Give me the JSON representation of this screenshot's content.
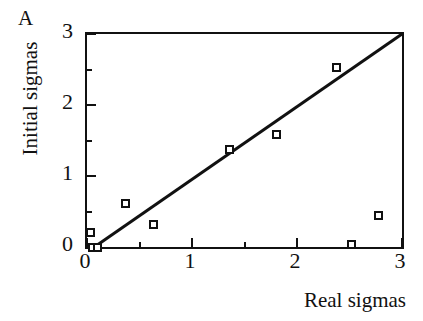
{
  "panel": {
    "label": "A"
  },
  "chart_data": {
    "type": "scatter",
    "title": "",
    "subtitle": "",
    "xlabel": "Real sigmas",
    "ylabel": "Initial sigmas",
    "xlim": [
      0,
      3
    ],
    "ylim": [
      0,
      3
    ],
    "xticks": [
      0,
      1,
      2,
      3
    ],
    "yticks": [
      0,
      1,
      2,
      3
    ],
    "xtick_labels": [
      "0",
      "1",
      "2",
      "3"
    ],
    "ytick_labels": [
      "0",
      "1",
      "2",
      "3"
    ],
    "xminor_ticks": [
      0.5,
      1.5,
      2.5
    ],
    "yminor_ticks": [
      0.5,
      1.5,
      2.5
    ],
    "grid": false,
    "legend": null,
    "annotations": [
      "A"
    ],
    "marker_style": "open-square",
    "marker_color": "#111111",
    "series": [
      {
        "name": "sigmas",
        "points": [
          {
            "x": 0.03,
            "y": 0.21
          },
          {
            "x": 0.05,
            "y": 0.0
          },
          {
            "x": 0.1,
            "y": 0.0
          },
          {
            "x": 0.37,
            "y": 0.61
          },
          {
            "x": 0.63,
            "y": 0.31
          },
          {
            "x": 1.36,
            "y": 1.37
          },
          {
            "x": 1.8,
            "y": 1.59
          },
          {
            "x": 2.38,
            "y": 2.53
          },
          {
            "x": 2.52,
            "y": 0.04
          },
          {
            "x": 2.78,
            "y": 0.45
          }
        ]
      }
    ],
    "reference_line": {
      "name": "identity",
      "from": {
        "x": 0.07,
        "y": 0.0
      },
      "to": {
        "x": 3.0,
        "y": 3.0
      },
      "color": "#111111",
      "width": 3
    }
  }
}
